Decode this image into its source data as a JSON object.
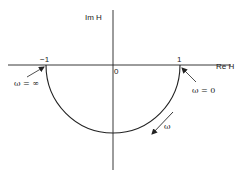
{
  "diagram": {
    "type": "nyquist-plot",
    "axes": {
      "real_label": "Re H",
      "imag_label": "Im H",
      "origin_label": "0"
    },
    "ticks": {
      "neg_one": "−1",
      "pos_one": "1"
    },
    "curve": {
      "shape": "lower semicircle",
      "from": "1",
      "to": "−1"
    },
    "annotations": {
      "omega_infinity": "ω = ∞",
      "omega_zero": "ω = 0",
      "omega_direction": "ω"
    },
    "colors": {
      "line": "#222222",
      "background": "#ffffff"
    }
  }
}
